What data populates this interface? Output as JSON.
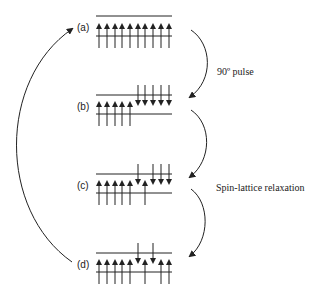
{
  "diagram": {
    "states": [
      {
        "label": "(a)",
        "spins": [
          "up",
          "up",
          "up",
          "up",
          "up",
          "up",
          "up",
          "up",
          "up",
          "up"
        ]
      },
      {
        "label": "(b)",
        "spins": [
          "up",
          "up",
          "up",
          "up",
          "up",
          "down",
          "down",
          "down",
          "down",
          "down"
        ]
      },
      {
        "label": "(c)",
        "spins": [
          "up",
          "up",
          "up",
          "up",
          "up",
          "down",
          "up",
          "down",
          "down",
          "down"
        ]
      },
      {
        "label": "(d)",
        "spins": [
          "up",
          "up",
          "up",
          "up",
          "up",
          "down",
          "up",
          "down",
          "up",
          "up"
        ]
      }
    ],
    "transitions": [
      {
        "from": "(a)",
        "to": "(b)",
        "label": "90º pulse"
      },
      {
        "from": "(b)",
        "to": "(c)",
        "label": "Spin-lattice relaxation"
      },
      {
        "from": "(c)",
        "to": "(d)",
        "label": ""
      },
      {
        "from": "(d)",
        "to": "(a)",
        "label": ""
      }
    ],
    "pulse_label": "90º pulse",
    "relaxation_label": "Spin-lattice relaxation",
    "colors": {
      "line": "#222222",
      "background": "#ffffff"
    }
  }
}
